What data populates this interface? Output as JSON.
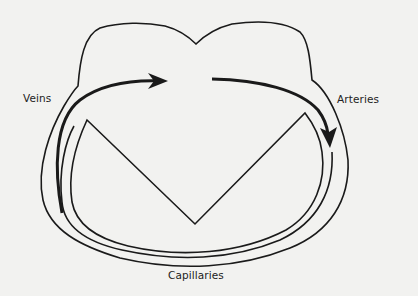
{
  "diagram": {
    "type": "circulatory-loop",
    "labels": {
      "veins": "Veins",
      "arteries": "Arteries",
      "capillaries": "Capillaries"
    },
    "elements": [
      {
        "id": "outer-loop",
        "description": "outer vessel outline forming heart top with notch"
      },
      {
        "id": "inner-heart",
        "description": "inner V-shaped heart outline"
      },
      {
        "id": "veins-flow-arrow",
        "direction": "up-and-right into heart",
        "label": "Veins"
      },
      {
        "id": "arteries-flow-arrow",
        "direction": "right and down out of heart",
        "label": "Arteries"
      }
    ],
    "colors": {
      "stroke": "#1a1a1a",
      "background": "#f2f2f0",
      "text": "#222222"
    }
  }
}
